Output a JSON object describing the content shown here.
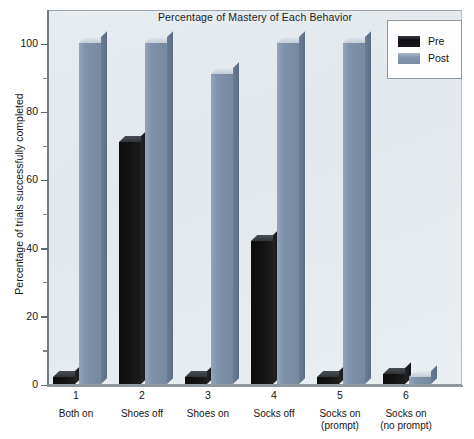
{
  "chart_data": {
    "type": "bar",
    "title": "Percentage of Mastery of Each Behavior",
    "xlabel": "",
    "ylabel": "Percentage of trials successfully completed",
    "ylim": [
      0,
      100
    ],
    "ytick_values": [
      0,
      20,
      40,
      60,
      80,
      100
    ],
    "ytick_labels": [
      "0",
      "20",
      "40",
      "60",
      "80",
      "100"
    ],
    "yminor_values": [
      10,
      30,
      50,
      70,
      90
    ],
    "grid": false,
    "legend_position": "top-right",
    "categories": [
      "Both on",
      "Shoes off",
      "Shoes on",
      "Socks off",
      "Socks on (prompt)",
      "Socks on (no prompt)"
    ],
    "category_numbers": [
      "1",
      "2",
      "3",
      "4",
      "5",
      "6"
    ],
    "category_lines": [
      [
        "Both on"
      ],
      [
        "Shoes off"
      ],
      [
        "Shoes on"
      ],
      [
        "Socks off"
      ],
      [
        "Socks on",
        "(prompt)"
      ],
      [
        "Socks on",
        "(no prompt)"
      ]
    ],
    "series": [
      {
        "name": "Pre",
        "color": "#111115",
        "values": [
          2,
          71,
          2,
          42,
          2,
          3
        ]
      },
      {
        "name": "Post",
        "color": "#7f92ab",
        "values": [
          100,
          100,
          91,
          100,
          100,
          2
        ]
      }
    ]
  },
  "legend": {
    "entries": [
      {
        "label": "Pre"
      },
      {
        "label": "Post"
      }
    ]
  },
  "colors": {
    "pre": "#111115",
    "post": "#7f92ab",
    "plot_background": "#e6ebf0",
    "axis": "#707b84",
    "text": "#141414"
  }
}
